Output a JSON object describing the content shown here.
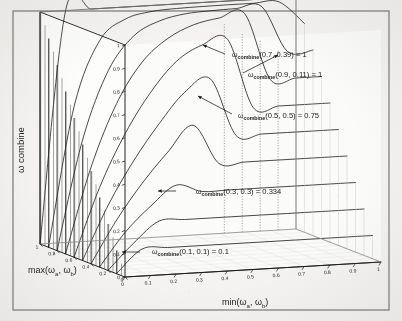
{
  "figure": {
    "background_color": "#f4f3f1",
    "ink_color": "#1a1a1a",
    "border_color": "#5a5a5a"
  },
  "chart_data": {
    "type": "line",
    "title": "",
    "subtitle": "",
    "projection": "3d-mesh",
    "xlabel": "min(ωa, ωb)",
    "ylabel": "max(ωa, ωb)",
    "zlabel": "ω combine",
    "xlabel_parts": {
      "fn": "min(",
      "sub_a": "a",
      "mid": ", ",
      "sub_b": "b",
      "end": ")",
      "omega": "ω"
    },
    "ylabel_parts": {
      "fn": "max(",
      "sub_a": "a",
      "mid": ", ",
      "sub_b": "b",
      "end": ")",
      "omega": "ω"
    },
    "zlabel_parts": {
      "omega": "ω",
      "word": "combine"
    },
    "xlim": [
      0,
      1
    ],
    "ylim": [
      0,
      1
    ],
    "zlim": [
      0,
      1
    ],
    "grid": false,
    "legend": "none",
    "x_ticks": [
      "0",
      "0.1",
      "0.2",
      "0.3",
      "0.4",
      "0.5",
      "0.6",
      "0.7",
      "0.8",
      "0.9",
      "1"
    ],
    "y_ticks": [
      "0",
      "0.2",
      "0.4",
      "0.6",
      "0.8",
      "1"
    ],
    "z_ticks": [
      "0",
      "0.1",
      "0.2",
      "0.3",
      "0.4",
      "0.5",
      "0.6",
      "0.7",
      "0.8",
      "0.9",
      "1"
    ],
    "x_values": [
      0,
      0.1,
      0.2,
      0.3,
      0.4,
      0.5,
      0.6,
      0.7,
      0.8,
      0.9,
      1
    ],
    "series": [
      {
        "name": "max = 0.0",
        "max": 0.0,
        "values": [
          0,
          0,
          0,
          0,
          0,
          0,
          0,
          0,
          0,
          0,
          0
        ]
      },
      {
        "name": "max = 0.1",
        "max": 0.1,
        "values": [
          0.0,
          0.1,
          0.1,
          0.1,
          0.1,
          0.1,
          0.1,
          0.1,
          0.1,
          0.1,
          0.1
        ]
      },
      {
        "name": "max = 0.2",
        "max": 0.2,
        "values": [
          0.0,
          0.111,
          0.2,
          0.2,
          0.2,
          0.2,
          0.2,
          0.2,
          0.2,
          0.2,
          0.2
        ]
      },
      {
        "name": "max = 0.3",
        "max": 0.3,
        "values": [
          0.0,
          0.143,
          0.25,
          0.334,
          0.3,
          0.3,
          0.3,
          0.3,
          0.3,
          0.3,
          0.3
        ]
      },
      {
        "name": "max = 0.4",
        "max": 0.4,
        "values": [
          0.0,
          0.182,
          0.334,
          0.462,
          0.571,
          0.4,
          0.4,
          0.4,
          0.4,
          0.4,
          0.4
        ]
      },
      {
        "name": "max = 0.5",
        "max": 0.5,
        "values": [
          0.0,
          0.231,
          0.417,
          0.571,
          0.7,
          0.75,
          0.5,
          0.5,
          0.5,
          0.5,
          0.5
        ]
      },
      {
        "name": "max = 0.6",
        "max": 0.6,
        "values": [
          0.0,
          0.294,
          0.52,
          0.692,
          0.818,
          0.882,
          0.9,
          0.6,
          0.6,
          0.6,
          0.6
        ]
      },
      {
        "name": "max = 0.7",
        "max": 0.7,
        "values": [
          0.0,
          0.368,
          0.636,
          0.808,
          0.903,
          0.955,
          0.978,
          0.99,
          0.7,
          0.7,
          0.7
        ]
      },
      {
        "name": "max = 0.8",
        "max": 0.8,
        "values": [
          0.0,
          0.471,
          0.762,
          0.906,
          0.964,
          0.988,
          0.995,
          0.998,
          1.0,
          0.8,
          0.8
        ]
      },
      {
        "name": "max = 0.9",
        "max": 0.9,
        "values": [
          0.0,
          0.6,
          0.878,
          0.964,
          0.99,
          0.997,
          0.999,
          1.0,
          1.0,
          1.0,
          0.9
        ]
      },
      {
        "name": "max = 1.0",
        "max": 1.0,
        "values": [
          0.0,
          1.0,
          1.0,
          1.0,
          1.0,
          1.0,
          1.0,
          1.0,
          1.0,
          1.0,
          1.0
        ]
      }
    ],
    "annotations": [
      {
        "id": "a1",
        "omega": "ω",
        "sub": "combine",
        "args": "(0.7, 0.39) = 1",
        "point_min": 0.39,
        "point_max": 0.7,
        "value": 1
      },
      {
        "id": "a2",
        "omega": "ω",
        "sub": "combine",
        "args": "(0.9, 0.11) = 1",
        "point_min": 0.11,
        "point_max": 0.9,
        "value": 1
      },
      {
        "id": "a3",
        "omega": "ω",
        "sub": "combine",
        "args": "(0.5, 0.5) = 0.75",
        "point_min": 0.5,
        "point_max": 0.5,
        "value": 0.75
      },
      {
        "id": "a4",
        "omega": "ω",
        "sub": "combine",
        "args": "(0.3, 0.3) = 0.334",
        "point_min": 0.3,
        "point_max": 0.3,
        "value": 0.334
      },
      {
        "id": "a5",
        "omega": "ω",
        "sub": "combine",
        "args": "(0.1, 0.1) = 0.1",
        "point_min": 0.1,
        "point_max": 0.1,
        "value": 0.1
      }
    ]
  }
}
